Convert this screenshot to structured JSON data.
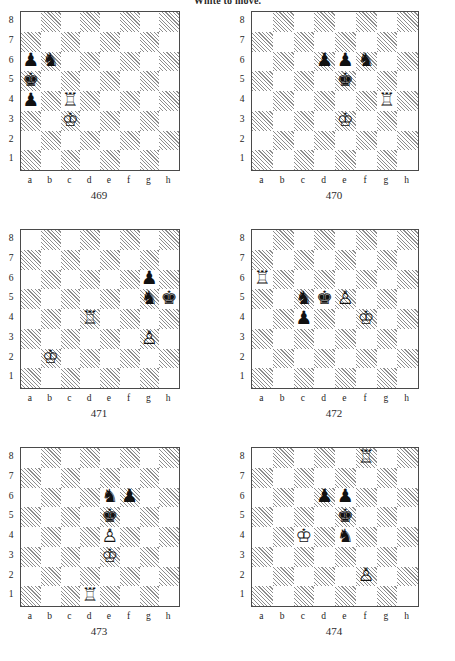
{
  "header": {
    "instruction": "White to move."
  },
  "board_meta": {
    "files": [
      "a",
      "b",
      "c",
      "d",
      "e",
      "f",
      "g",
      "h"
    ],
    "ranks": [
      "8",
      "7",
      "6",
      "5",
      "4",
      "3",
      "2",
      "1"
    ],
    "light_square_color": "#ffffff",
    "dark_square_color": "#8e8e8e",
    "border_color": "#4a4a4a"
  },
  "glyphs": {
    "white-king": "♔",
    "white-queen": "♕",
    "white-rook": "♖",
    "white-bishop": "♗",
    "white-knight": "♘",
    "white-pawn": "♙",
    "black-king": "♚",
    "black-queen": "♛",
    "black-rook": "♜",
    "black-bishop": "♝",
    "black-knight": "♞",
    "black-pawn": "♟"
  },
  "diagrams": [
    {
      "number": "469",
      "pieces": [
        {
          "square": "a6",
          "piece": "black-pawn"
        },
        {
          "square": "b6",
          "piece": "black-knight"
        },
        {
          "square": "a5",
          "piece": "black-king"
        },
        {
          "square": "a4",
          "piece": "black-pawn"
        },
        {
          "square": "c4",
          "piece": "white-rook"
        },
        {
          "square": "c3",
          "piece": "white-king"
        }
      ]
    },
    {
      "number": "470",
      "pieces": [
        {
          "square": "d6",
          "piece": "black-pawn"
        },
        {
          "square": "e6",
          "piece": "black-pawn"
        },
        {
          "square": "f6",
          "piece": "black-knight"
        },
        {
          "square": "e5",
          "piece": "black-king"
        },
        {
          "square": "g4",
          "piece": "white-rook"
        },
        {
          "square": "e3",
          "piece": "white-king"
        }
      ]
    },
    {
      "number": "471",
      "pieces": [
        {
          "square": "g6",
          "piece": "black-pawn"
        },
        {
          "square": "g5",
          "piece": "black-knight"
        },
        {
          "square": "h5",
          "piece": "black-king"
        },
        {
          "square": "d4",
          "piece": "white-rook"
        },
        {
          "square": "g3",
          "piece": "white-pawn"
        },
        {
          "square": "b2",
          "piece": "white-king"
        }
      ]
    },
    {
      "number": "472",
      "pieces": [
        {
          "square": "a6",
          "piece": "white-rook"
        },
        {
          "square": "c5",
          "piece": "black-knight"
        },
        {
          "square": "d5",
          "piece": "black-king"
        },
        {
          "square": "e5",
          "piece": "white-pawn"
        },
        {
          "square": "c4",
          "piece": "black-pawn"
        },
        {
          "square": "f4",
          "piece": "white-king"
        }
      ]
    },
    {
      "number": "473",
      "pieces": [
        {
          "square": "e6",
          "piece": "black-knight"
        },
        {
          "square": "f6",
          "piece": "black-pawn"
        },
        {
          "square": "e5",
          "piece": "black-king"
        },
        {
          "square": "e4",
          "piece": "white-pawn"
        },
        {
          "square": "e3",
          "piece": "white-king"
        },
        {
          "square": "d1",
          "piece": "white-rook"
        }
      ]
    },
    {
      "number": "474",
      "pieces": [
        {
          "square": "f8",
          "piece": "white-rook"
        },
        {
          "square": "d6",
          "piece": "black-pawn"
        },
        {
          "square": "e6",
          "piece": "black-pawn"
        },
        {
          "square": "e5",
          "piece": "black-king"
        },
        {
          "square": "c4",
          "piece": "white-king"
        },
        {
          "square": "e4",
          "piece": "black-knight"
        },
        {
          "square": "f2",
          "piece": "white-pawn"
        }
      ]
    }
  ]
}
